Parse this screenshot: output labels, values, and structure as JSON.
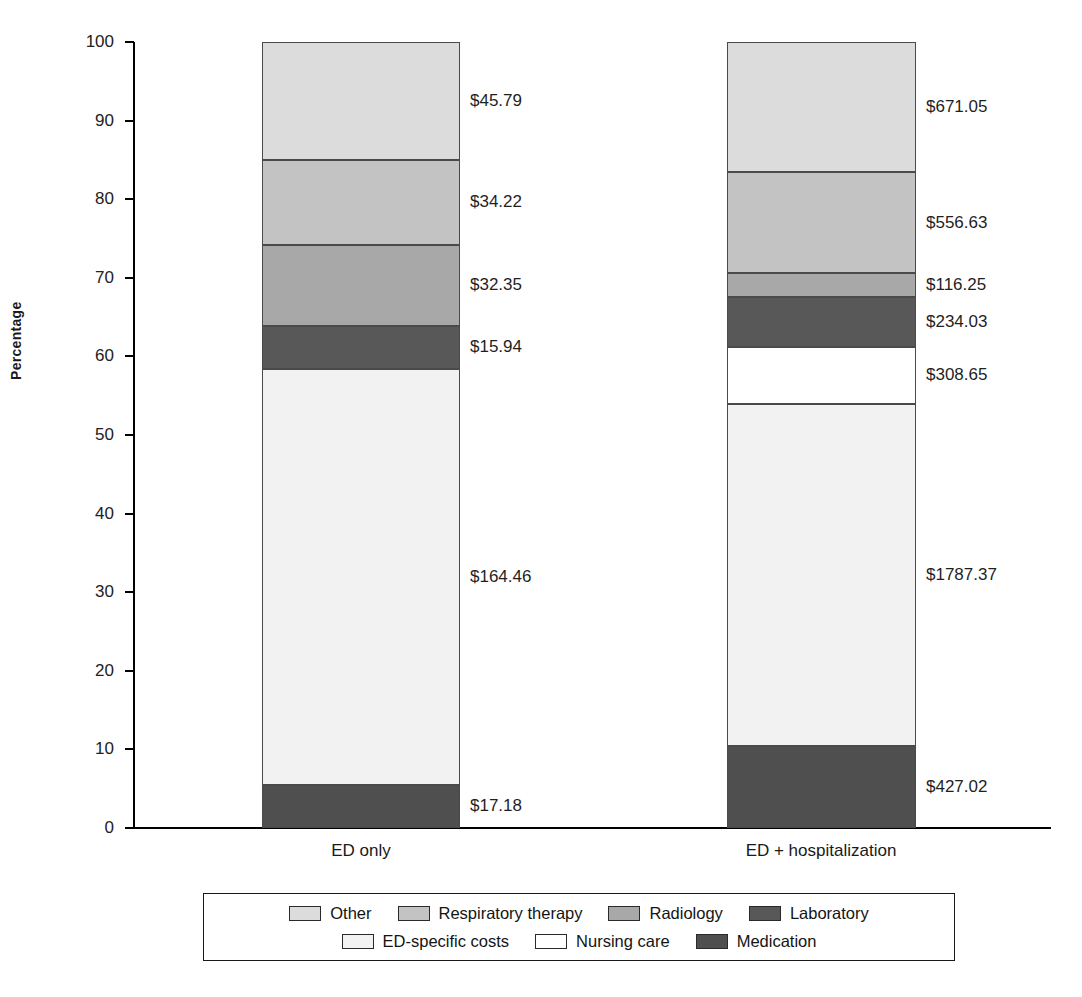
{
  "chart_data": {
    "type": "bar",
    "title": "",
    "subtitle": "",
    "xlabel": "",
    "ylabel": "Percentage",
    "ylim": [
      0,
      100
    ],
    "grid": false,
    "stacked": true,
    "stack_normalized_percent": true,
    "legend_position": "bottom",
    "legend_rows": [
      [
        "Other",
        "Respiratory therapy",
        "Radiology",
        "Laboratory"
      ],
      [
        "ED-specific costs",
        "Nursing care",
        "Medication"
      ]
    ],
    "categories": [
      "ED only",
      "ED + hospitalization"
    ],
    "y_ticks": [
      0,
      10,
      20,
      30,
      40,
      50,
      60,
      70,
      80,
      90,
      100
    ],
    "y_tick_labels": [
      "0",
      "10",
      "20",
      "30",
      "40",
      "50",
      "60",
      "70",
      "80",
      "90",
      "100"
    ],
    "series": [
      {
        "name": "Other",
        "color": "#dcdcdc",
        "values_percent": [
          15.0,
          16.6
        ],
        "labels": [
          "$45.79",
          "$671.05"
        ],
        "amounts": [
          45.79,
          671.05
        ]
      },
      {
        "name": "Respiratory therapy",
        "color": "#c3c3c3",
        "values_percent": [
          10.8,
          12.8
        ],
        "labels": [
          "$34.22",
          "$556.63"
        ],
        "amounts": [
          34.22,
          556.63
        ]
      },
      {
        "name": "Radiology",
        "color": "#a8a8a8",
        "values_percent": [
          10.3,
          3.1
        ],
        "labels": [
          "$32.35",
          "$116.25"
        ],
        "amounts": [
          32.35,
          116.25
        ]
      },
      {
        "name": "Laboratory",
        "color": "#585858",
        "values_percent": [
          5.5,
          6.3
        ],
        "labels": [
          "$15.94",
          "$234.03"
        ],
        "amounts": [
          15.94,
          234.03
        ]
      },
      {
        "name": "Nursing care",
        "color": "#ffffff",
        "values_percent": [
          0.0,
          7.2
        ],
        "labels": [
          "",
          "$308.65"
        ],
        "amounts": [
          0,
          308.65
        ]
      },
      {
        "name": "ED-specific costs",
        "color": "#f2f2f2",
        "values_percent": [
          52.9,
          43.6
        ],
        "labels": [
          "$164.46",
          "$1787.37"
        ],
        "amounts": [
          164.46,
          1787.37
        ]
      },
      {
        "name": "Medication",
        "color": "#4f4f4f",
        "values_percent": [
          5.5,
          10.4
        ],
        "labels": [
          "$17.18",
          "$427.02"
        ],
        "amounts": [
          17.18,
          427.02
        ]
      }
    ]
  },
  "axis": {
    "y_title": "Percentage"
  },
  "bars": [
    {
      "category": "ED only",
      "segments": [
        {
          "name": "Other",
          "label": "$45.79",
          "top_pct": 100.0,
          "bottom_pct": 85.0,
          "class": "sw-other"
        },
        {
          "name": "Respiratory therapy",
          "label": "$34.22",
          "top_pct": 85.0,
          "bottom_pct": 74.2,
          "class": "sw-resp"
        },
        {
          "name": "Radiology",
          "label": "$32.35",
          "top_pct": 74.2,
          "bottom_pct": 63.9,
          "class": "sw-rad"
        },
        {
          "name": "Laboratory",
          "label": "$15.94",
          "top_pct": 63.9,
          "bottom_pct": 58.4,
          "class": "sw-lab"
        },
        {
          "name": "ED-specific costs",
          "label": "$164.46",
          "top_pct": 58.4,
          "bottom_pct": 5.5,
          "class": "sw-edspecific"
        },
        {
          "name": "Medication",
          "label": "$17.18",
          "top_pct": 5.5,
          "bottom_pct": 0.0,
          "class": "sw-med"
        }
      ]
    },
    {
      "category": "ED + hospitalization",
      "segments": [
        {
          "name": "Other",
          "label": "$671.05",
          "top_pct": 100.0,
          "bottom_pct": 83.4,
          "class": "sw-other"
        },
        {
          "name": "Respiratory therapy",
          "label": "$556.63",
          "top_pct": 83.4,
          "bottom_pct": 70.6,
          "class": "sw-resp"
        },
        {
          "name": "Radiology",
          "label": "$116.25",
          "top_pct": 70.6,
          "bottom_pct": 67.5,
          "class": "sw-rad"
        },
        {
          "name": "Laboratory",
          "label": "$234.03",
          "top_pct": 67.5,
          "bottom_pct": 61.2,
          "class": "sw-lab"
        },
        {
          "name": "Nursing care",
          "label": "$308.65",
          "top_pct": 61.2,
          "bottom_pct": 54.0,
          "class": "sw-nursing"
        },
        {
          "name": "ED-specific costs",
          "label": "$1787.37",
          "top_pct": 54.0,
          "bottom_pct": 10.4,
          "class": "sw-edspecific"
        },
        {
          "name": "Medication",
          "label": "$427.02",
          "top_pct": 10.4,
          "bottom_pct": 0.0,
          "class": "sw-med"
        }
      ]
    }
  ],
  "legend": {
    "rows": [
      [
        {
          "name": "Other",
          "class": "sw-other"
        },
        {
          "name": "Respiratory therapy",
          "class": "sw-resp"
        },
        {
          "name": "Radiology",
          "class": "sw-rad"
        },
        {
          "name": "Laboratory",
          "class": "sw-lab"
        }
      ],
      [
        {
          "name": "ED-specific costs",
          "class": "sw-edspecific"
        },
        {
          "name": "Nursing care",
          "class": "sw-nursing"
        },
        {
          "name": "Medication",
          "class": "sw-med"
        }
      ]
    ]
  },
  "value_labels": {
    "left": [
      "$45.79",
      "$34.22",
      "$32.35",
      "$15.94",
      "$164.46",
      "$17.18"
    ],
    "right": [
      "$671.05",
      "$556.63",
      "$116.25",
      "$234.03",
      "$308.65",
      "$1787.37",
      "$427.02"
    ]
  }
}
